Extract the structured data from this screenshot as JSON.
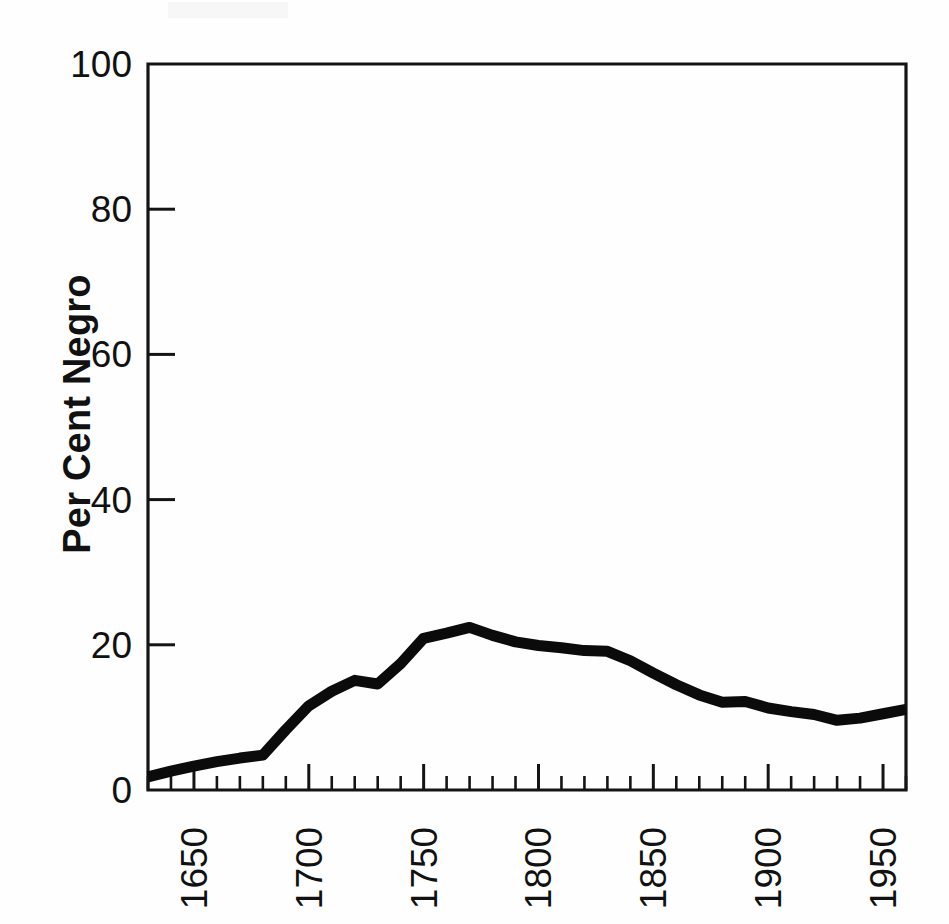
{
  "figure": {
    "background_color": "#fefefe",
    "ink_color": "#0b0b0b",
    "axis_color": "#141414"
  },
  "chart_data": {
    "type": "line",
    "title": "",
    "subtitle": "",
    "xlabel": "",
    "ylabel": "Per Cent Negro",
    "xlim": [
      1630,
      1960
    ],
    "ylim": [
      0,
      100
    ],
    "grid": false,
    "legend": false,
    "legend_position": "none",
    "y_ticks": [
      0,
      20,
      40,
      60,
      80,
      100
    ],
    "y_tick_labels": [
      "0",
      "20",
      "40",
      "60",
      "80",
      "100"
    ],
    "y_ticks_with_marks": [
      20,
      40,
      60,
      80
    ],
    "x_ticks_major": [
      1650,
      1700,
      1750,
      1800,
      1850,
      1900,
      1950
    ],
    "x_tick_labels": [
      "1650",
      "1700",
      "1750",
      "1800",
      "1850",
      "1900",
      "1950"
    ],
    "x_minor_tick_interval": 10,
    "x_tick_label_rotation": -90,
    "y_axis_title_rotation": -90,
    "series": [
      {
        "name": "Per Cent Negro",
        "color": "#0b0b0b",
        "line_width": 11,
        "x": [
          1630,
          1640,
          1650,
          1660,
          1670,
          1680,
          1690,
          1700,
          1710,
          1720,
          1730,
          1740,
          1750,
          1760,
          1770,
          1780,
          1790,
          1800,
          1810,
          1820,
          1830,
          1840,
          1850,
          1860,
          1870,
          1880,
          1890,
          1900,
          1910,
          1920,
          1930,
          1940,
          1950,
          1960
        ],
        "values": [
          1.8,
          2.6,
          3.3,
          3.9,
          4.4,
          4.8,
          8.3,
          11.6,
          13.6,
          15.1,
          14.6,
          17.4,
          20.9,
          21.6,
          22.4,
          21.3,
          20.4,
          19.9,
          19.6,
          19.2,
          19.1,
          17.8,
          16.1,
          14.5,
          13.1,
          12.1,
          12.2,
          11.3,
          10.8,
          10.4,
          9.6,
          9.9,
          10.5,
          11.1
        ]
      }
    ]
  },
  "axis_titles": {
    "y": "Per Cent Negro"
  }
}
